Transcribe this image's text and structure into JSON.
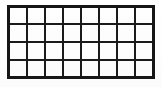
{
  "figure": {
    "type": "grid-diagram"
  },
  "grid": {
    "rows": 4,
    "columns": 8,
    "total_cells": 32,
    "cells_filled": 0,
    "cell_label": "",
    "row_labels": [
      "",
      "",
      "",
      ""
    ],
    "column_labels": [
      "",
      "",
      "",
      "",
      "",
      "",
      "",
      ""
    ],
    "cells": [
      [
        "",
        "",
        "",
        "",
        "",
        "",
        "",
        ""
      ],
      [
        "",
        "",
        "",
        "",
        "",
        "",
        "",
        ""
      ],
      [
        "",
        "",
        "",
        "",
        "",
        "",
        "",
        ""
      ],
      [
        "",
        "",
        "",
        "",
        "",
        "",
        "",
        ""
      ]
    ]
  },
  "style": {
    "outer_border_color": "#161616",
    "cell_border_color": "#1a1a1a",
    "cell_fill_color": "#fefefe",
    "page_background": "#ffffff",
    "outer_border_width_px": 3,
    "cell_border_width_px": 2
  },
  "geometry": {
    "grid_left_px": 7,
    "grid_top_px": 5,
    "grid_width_px": 148,
    "grid_height_px": 74,
    "canvas_width_px": 162,
    "canvas_height_px": 87
  }
}
